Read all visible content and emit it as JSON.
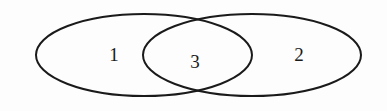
{
  "diagram": {
    "type": "venn",
    "stroke_color": "#1a1a1a",
    "background_color": "#fdfdfd",
    "sets": [
      {
        "id": "left",
        "cx": 144,
        "cy": 55,
        "rx": 108,
        "ry": 41
      },
      {
        "id": "right",
        "cx": 252,
        "cy": 55,
        "rx": 109,
        "ry": 41
      }
    ],
    "labels": [
      {
        "region": "left-only",
        "text": "1",
        "x": 114,
        "y": 61
      },
      {
        "region": "intersection",
        "text": "3",
        "x": 195,
        "y": 68
      },
      {
        "region": "right-only",
        "text": "2",
        "x": 299,
        "y": 61
      }
    ]
  }
}
